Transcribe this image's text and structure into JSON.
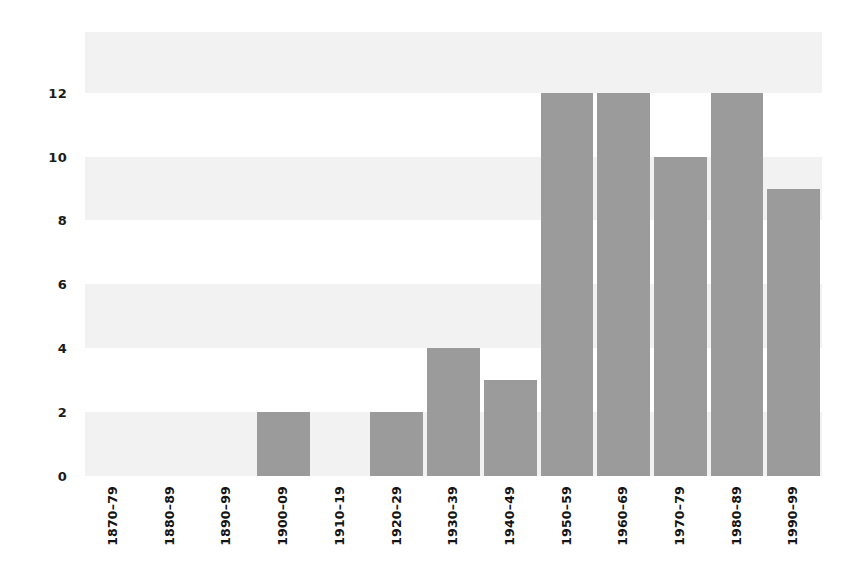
{
  "chart_data": {
    "type": "bar",
    "title": "",
    "subtitle": "",
    "xlabel": "",
    "ylabel": "",
    "categories": [
      "1870–79",
      "1880–89",
      "1890–99",
      "1900–09",
      "1910–19",
      "1920–29",
      "1930–39",
      "1940–49",
      "1950–59",
      "1960–69",
      "1970–79",
      "1980–89",
      "1990–99"
    ],
    "values": [
      0,
      0,
      0,
      2,
      0,
      2,
      4,
      3,
      12,
      12,
      10,
      12,
      9
    ],
    "ylim": [
      0,
      13.9
    ],
    "yticks": [
      0,
      2,
      4,
      6,
      8,
      10,
      12
    ],
    "ytick_labels": [
      "0",
      "2",
      "4",
      "6",
      "8",
      "10",
      "12"
    ],
    "grid": "horizontal-alternating-bands",
    "legend": "none",
    "bar_color": "#9b9b9b",
    "band_color": "#f2f2f2",
    "background_color": "#ffffff",
    "tick_label_color": "#1b1b1b",
    "xtick_rotation": 90
  }
}
